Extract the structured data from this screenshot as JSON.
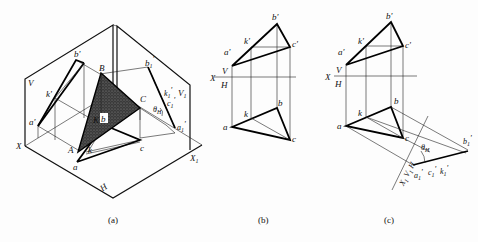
{
  "figure": {
    "panels": [
      {
        "id": "a",
        "caption": "(a)",
        "description": "Isometric view of triangle ABC between V, H and auxiliary V1 planes",
        "labels": {
          "V": "V",
          "H": "H",
          "X": "X",
          "X1": "X",
          "X1_sub": "1",
          "V1": "V",
          "V1_sub": "1",
          "B": "B",
          "C": "C",
          "A": "A",
          "K": "K",
          "b_prime": "b'",
          "k_prime": "k'",
          "a_prime": "a'",
          "c_prime": "c'",
          "b1_prime": "b",
          "b1_sub": "1",
          "k1_prime": "k",
          "k1_sub": "1",
          "c1_prime": "c",
          "c1_sub": "1",
          "a1_prime": "a",
          "a1_sub": "1",
          "theta": "θ",
          "theta_sub": "H",
          "a": "a",
          "b": "b",
          "c": "c",
          "k": "k"
        }
      },
      {
        "id": "b",
        "caption": "(b)",
        "description": "Orthographic projections of triangle abc with line ak",
        "labels": {
          "b_prime": "b'",
          "k_prime": "k'",
          "a_prime": "a'",
          "c_prime": "c'",
          "X": "X",
          "V": "V",
          "H": "H",
          "a": "a",
          "b": "b",
          "c": "c",
          "k": "k"
        }
      },
      {
        "id": "c",
        "caption": "(c)",
        "description": "Auxiliary projection on V1 showing edge view and angle θH",
        "labels": {
          "b_prime": "b'",
          "k_prime": "k'",
          "a_prime": "a'",
          "c_prime": "c'",
          "X": "X",
          "V": "V",
          "H": "H",
          "a": "a",
          "b": "b",
          "c": "c",
          "k": "k",
          "X1": "X",
          "X1_sub": "1",
          "H_aux": "H",
          "V1": "V",
          "V1_sub": "1",
          "theta": "θ",
          "theta_sub": "H",
          "b1_prime": "b",
          "b1_sub": "1",
          "a1_prime": "a",
          "a1_sub": "1",
          "c1k1": "c",
          "c1k1_sub": "1",
          "k1": "k",
          "k1_sub": "1"
        }
      }
    ]
  }
}
